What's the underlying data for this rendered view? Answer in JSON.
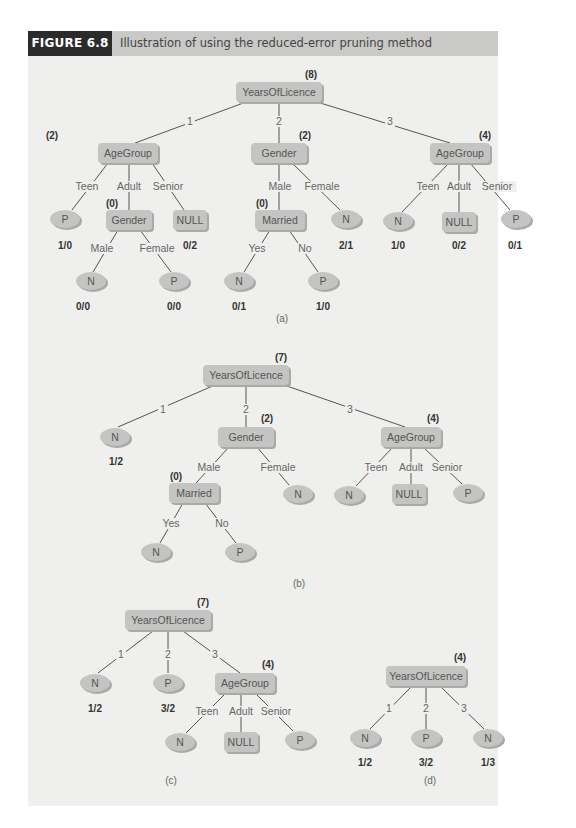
{
  "figure": {
    "label": "FIGURE 6.8",
    "title": "Illustration of using the reduced-error pruning method",
    "colors": {
      "header_dark": "#2b2b2b",
      "header_bar": "#c9c9c7",
      "panel": "#efefed",
      "node": "#c4c4c2"
    }
  },
  "trees": [
    {
      "caption": "(a)",
      "caption_pos": [
        282,
        322
      ],
      "nodes": [
        {
          "id": "a_root",
          "shape": "rect",
          "label": "YearsOfLicence",
          "x": 279,
          "y": 92,
          "w": 86,
          "h": 20,
          "count": "(8)",
          "count_pos": [
            311,
            74
          ]
        },
        {
          "id": "a_age1",
          "shape": "rect",
          "label": "AgeGroup",
          "x": 128,
          "y": 153,
          "w": 60,
          "h": 20,
          "count": "(2)",
          "count_pos": [
            52,
            135
          ]
        },
        {
          "id": "a_gen",
          "shape": "rect",
          "label": "Gender",
          "x": 279,
          "y": 153,
          "w": 56,
          "h": 20,
          "count": "(2)",
          "count_pos": [
            305,
            135
          ]
        },
        {
          "id": "a_age3",
          "shape": "rect",
          "label": "AgeGroup",
          "x": 460,
          "y": 153,
          "w": 60,
          "h": 20,
          "count": "(4)",
          "count_pos": [
            485,
            135
          ]
        },
        {
          "id": "a_p1",
          "shape": "ellipse",
          "label": "P",
          "x": 65,
          "y": 219,
          "w": 30,
          "h": 18,
          "count": "1/0",
          "count_pos": [
            65,
            245
          ]
        },
        {
          "id": "a_gen2",
          "shape": "rect",
          "label": "Gender",
          "x": 129,
          "y": 220,
          "w": 46,
          "h": 20,
          "count": "(0)",
          "count_pos": [
            112,
            203
          ]
        },
        {
          "id": "a_null1",
          "shape": "rect",
          "label": "NULL",
          "x": 190,
          "y": 220,
          "w": 34,
          "h": 20,
          "count": "0/2",
          "count_pos": [
            190,
            245
          ]
        },
        {
          "id": "a_n_m",
          "shape": "ellipse",
          "label": "N",
          "x": 91,
          "y": 281,
          "w": 30,
          "h": 18,
          "count": "0/0",
          "count_pos": [
            83,
            306
          ]
        },
        {
          "id": "a_p_f",
          "shape": "ellipse",
          "label": "P",
          "x": 174,
          "y": 281,
          "w": 30,
          "h": 18,
          "count": "0/0",
          "count_pos": [
            174,
            306
          ]
        },
        {
          "id": "a_mar",
          "shape": "rect",
          "label": "Married",
          "x": 280,
          "y": 220,
          "w": 50,
          "h": 20,
          "count": "(0)",
          "count_pos": [
            262,
            203
          ]
        },
        {
          "id": "a_n_fem",
          "shape": "ellipse",
          "label": "N",
          "x": 346,
          "y": 219,
          "w": 30,
          "h": 18,
          "count": "2/1",
          "count_pos": [
            346,
            245
          ]
        },
        {
          "id": "a_n_yes",
          "shape": "ellipse",
          "label": "N",
          "x": 239,
          "y": 281,
          "w": 30,
          "h": 18,
          "count": "0/1",
          "count_pos": [
            239,
            306
          ]
        },
        {
          "id": "a_p_no",
          "shape": "ellipse",
          "label": "P",
          "x": 323,
          "y": 281,
          "w": 30,
          "h": 18,
          "count": "1/0",
          "count_pos": [
            323,
            306
          ]
        },
        {
          "id": "a_n_teen",
          "shape": "ellipse",
          "label": "N",
          "x": 398,
          "y": 221,
          "w": 30,
          "h": 18,
          "count": "1/0",
          "count_pos": [
            398,
            245
          ]
        },
        {
          "id": "a_null3",
          "shape": "rect",
          "label": "NULL",
          "x": 459,
          "y": 222,
          "w": 34,
          "h": 20,
          "count": "0/2",
          "count_pos": [
            459,
            245
          ]
        },
        {
          "id": "a_p_sen",
          "shape": "ellipse",
          "label": "P",
          "x": 516,
          "y": 219,
          "w": 30,
          "h": 18,
          "count": "0/1",
          "count_pos": [
            515,
            245
          ]
        }
      ],
      "edges": [
        {
          "from": "a_root",
          "to": "a_age1",
          "label": "1",
          "label_pos": [
            190,
            124
          ],
          "x1": 246,
          "y1": 102,
          "x2": 135,
          "y2": 143
        },
        {
          "from": "a_root",
          "to": "a_gen",
          "label": "2",
          "label_pos": [
            279,
            124
          ],
          "x1": 279,
          "y1": 102,
          "x2": 279,
          "y2": 143
        },
        {
          "from": "a_root",
          "to": "a_age3",
          "label": "3",
          "label_pos": [
            390,
            124
          ],
          "x1": 317,
          "y1": 102,
          "x2": 450,
          "y2": 143
        },
        {
          "from": "a_age1",
          "to": "a_p1",
          "label": "Teen",
          "label_pos": [
            87,
            189
          ],
          "x1": 108,
          "y1": 163,
          "x2": 72,
          "y2": 210
        },
        {
          "from": "a_age1",
          "to": "a_gen2",
          "label": "Adult",
          "label_pos": [
            129,
            189
          ],
          "x1": 129,
          "y1": 163,
          "x2": 129,
          "y2": 210
        },
        {
          "from": "a_age1",
          "to": "a_null1",
          "label": "Senior",
          "label_pos": [
            168,
            189
          ],
          "x1": 152,
          "y1": 163,
          "x2": 184,
          "y2": 210
        },
        {
          "from": "a_gen2",
          "to": "a_n_m",
          "label": "Male",
          "label_pos": [
            102,
            251
          ],
          "x1": 118,
          "y1": 230,
          "x2": 93,
          "y2": 272
        },
        {
          "from": "a_gen2",
          "to": "a_p_f",
          "label": "Female",
          "label_pos": [
            157,
            251
          ],
          "x1": 140,
          "y1": 230,
          "x2": 171,
          "y2": 272
        },
        {
          "from": "a_gen",
          "to": "a_mar",
          "label": "Male",
          "label_pos": [
            280,
            189
          ],
          "x1": 279,
          "y1": 163,
          "x2": 279,
          "y2": 210
        },
        {
          "from": "a_gen",
          "to": "a_n_fem",
          "label": "Female",
          "label_pos": [
            322,
            189
          ],
          "x1": 292,
          "y1": 163,
          "x2": 340,
          "y2": 210
        },
        {
          "from": "a_mar",
          "to": "a_n_yes",
          "label": "Yes",
          "label_pos": [
            257,
            251
          ],
          "x1": 270,
          "y1": 230,
          "x2": 244,
          "y2": 272
        },
        {
          "from": "a_mar",
          "to": "a_p_no",
          "label": "No",
          "label_pos": [
            305,
            251
          ],
          "x1": 289,
          "y1": 230,
          "x2": 318,
          "y2": 272
        },
        {
          "from": "a_age3",
          "to": "a_n_teen",
          "label": "Teen",
          "label_pos": [
            428,
            189
          ],
          "x1": 449,
          "y1": 163,
          "x2": 402,
          "y2": 212
        },
        {
          "from": "a_age3",
          "to": "a_null3",
          "label": "Adult",
          "label_pos": [
            459,
            189
          ],
          "x1": 459,
          "y1": 163,
          "x2": 459,
          "y2": 212
        },
        {
          "from": "a_age3",
          "to": "a_p_sen",
          "label": "Senior",
          "label_pos": [
            497,
            189
          ],
          "x1": 470,
          "y1": 163,
          "x2": 510,
          "y2": 210
        }
      ]
    },
    {
      "caption": "(b)",
      "caption_pos": [
        299,
        587
      ],
      "nodes": [
        {
          "id": "b_root",
          "shape": "rect",
          "label": "YearsOfLicence",
          "x": 246,
          "y": 375,
          "w": 86,
          "h": 20,
          "count": "(7)",
          "count_pos": [
            281,
            357
          ]
        },
        {
          "id": "b_n1",
          "shape": "ellipse",
          "label": "N",
          "x": 115,
          "y": 437,
          "w": 30,
          "h": 18,
          "count": "1/2",
          "count_pos": [
            116,
            461
          ]
        },
        {
          "id": "b_gen",
          "shape": "rect",
          "label": "Gender",
          "x": 246,
          "y": 437,
          "w": 56,
          "h": 20,
          "count": "(2)",
          "count_pos": [
            267,
            418
          ]
        },
        {
          "id": "b_age",
          "shape": "rect",
          "label": "AgeGroup",
          "x": 411,
          "y": 437,
          "w": 60,
          "h": 20,
          "count": "(4)",
          "count_pos": [
            433,
            418
          ]
        },
        {
          "id": "b_mar",
          "shape": "rect",
          "label": "Married",
          "x": 194,
          "y": 493,
          "w": 50,
          "h": 20,
          "count": "(0)",
          "count_pos": [
            176,
            476
          ]
        },
        {
          "id": "b_n_fem",
          "shape": "ellipse",
          "label": "N",
          "x": 298,
          "y": 494,
          "w": 30,
          "h": 18
        },
        {
          "id": "b_n_teen",
          "shape": "ellipse",
          "label": "N",
          "x": 349,
          "y": 495,
          "w": 30,
          "h": 18
        },
        {
          "id": "b_null",
          "shape": "rect",
          "label": "NULL",
          "x": 409,
          "y": 494,
          "w": 34,
          "h": 20
        },
        {
          "id": "b_p_sen",
          "shape": "ellipse",
          "label": "P",
          "x": 468,
          "y": 493,
          "w": 30,
          "h": 18
        },
        {
          "id": "b_n_yes",
          "shape": "ellipse",
          "label": "N",
          "x": 156,
          "y": 552,
          "w": 30,
          "h": 18
        },
        {
          "id": "b_p_no",
          "shape": "ellipse",
          "label": "P",
          "x": 240,
          "y": 552,
          "w": 30,
          "h": 18
        }
      ],
      "edges": [
        {
          "from": "b_root",
          "to": "b_n1",
          "label": "1",
          "label_pos": [
            163,
            412
          ],
          "x1": 215,
          "y1": 385,
          "x2": 118,
          "y2": 427
        },
        {
          "from": "b_root",
          "to": "b_gen",
          "label": "2",
          "label_pos": [
            246,
            412
          ],
          "x1": 246,
          "y1": 385,
          "x2": 246,
          "y2": 427
        },
        {
          "from": "b_root",
          "to": "b_age",
          "label": "3",
          "label_pos": [
            350,
            412
          ],
          "x1": 284,
          "y1": 385,
          "x2": 405,
          "y2": 427
        },
        {
          "from": "b_gen",
          "to": "b_mar",
          "label": "Male",
          "label_pos": [
            209,
            470
          ],
          "x1": 229,
          "y1": 447,
          "x2": 196,
          "y2": 483
        },
        {
          "from": "b_gen",
          "to": "b_n_fem",
          "label": "Female",
          "label_pos": [
            278,
            470
          ],
          "x1": 257,
          "y1": 447,
          "x2": 289,
          "y2": 485
        },
        {
          "from": "b_age",
          "to": "b_n_teen",
          "label": "Teen",
          "label_pos": [
            376,
            470
          ],
          "x1": 393,
          "y1": 447,
          "x2": 356,
          "y2": 486
        },
        {
          "from": "b_age",
          "to": "b_null",
          "label": "Adult",
          "label_pos": [
            411,
            470
          ],
          "x1": 411,
          "y1": 447,
          "x2": 411,
          "y2": 484
        },
        {
          "from": "b_age",
          "to": "b_p_sen",
          "label": "Senior",
          "label_pos": [
            447,
            470
          ],
          "x1": 423,
          "y1": 447,
          "x2": 462,
          "y2": 484
        },
        {
          "from": "b_mar",
          "to": "b_n_yes",
          "label": "Yes",
          "label_pos": [
            171,
            526
          ],
          "x1": 183,
          "y1": 503,
          "x2": 160,
          "y2": 543
        },
        {
          "from": "b_mar",
          "to": "b_p_no",
          "label": "No",
          "label_pos": [
            222,
            526
          ],
          "x1": 205,
          "y1": 503,
          "x2": 236,
          "y2": 543
        }
      ]
    },
    {
      "caption": "(c)",
      "caption_pos": [
        171,
        784
      ],
      "nodes": [
        {
          "id": "c_root",
          "shape": "rect",
          "label": "YearsOfLicence",
          "x": 168,
          "y": 620,
          "w": 86,
          "h": 20,
          "count": "(7)",
          "count_pos": [
            203,
            602
          ]
        },
        {
          "id": "c_n1",
          "shape": "ellipse",
          "label": "N",
          "x": 95,
          "y": 683,
          "w": 30,
          "h": 18,
          "count": "1/2",
          "count_pos": [
            95,
            708
          ]
        },
        {
          "id": "c_p2",
          "shape": "ellipse",
          "label": "P",
          "x": 168,
          "y": 683,
          "w": 30,
          "h": 18,
          "count": "3/2",
          "count_pos": [
            168,
            708
          ]
        },
        {
          "id": "c_age",
          "shape": "rect",
          "label": "AgeGroup",
          "x": 245,
          "y": 683,
          "w": 60,
          "h": 20,
          "count": "(4)",
          "count_pos": [
            268,
            664
          ]
        },
        {
          "id": "c_n_teen",
          "shape": "ellipse",
          "label": "N",
          "x": 180,
          "y": 742,
          "w": 30,
          "h": 18
        },
        {
          "id": "c_null",
          "shape": "rect",
          "label": "NULL",
          "x": 241,
          "y": 742,
          "w": 34,
          "h": 20
        },
        {
          "id": "c_p_sen",
          "shape": "ellipse",
          "label": "P",
          "x": 300,
          "y": 740,
          "w": 30,
          "h": 18
        }
      ],
      "edges": [
        {
          "from": "c_root",
          "to": "c_n1",
          "label": "1",
          "label_pos": [
            121,
            657
          ],
          "x1": 153,
          "y1": 631,
          "x2": 98,
          "y2": 673
        },
        {
          "from": "c_root",
          "to": "c_p2",
          "label": "2",
          "label_pos": [
            168,
            657
          ],
          "x1": 168,
          "y1": 631,
          "x2": 168,
          "y2": 673
        },
        {
          "from": "c_root",
          "to": "c_age",
          "label": "3",
          "label_pos": [
            215,
            657
          ],
          "x1": 183,
          "y1": 631,
          "x2": 240,
          "y2": 673
        },
        {
          "from": "c_age",
          "to": "c_n_teen",
          "label": "Teen",
          "label_pos": [
            207,
            714
          ],
          "x1": 226,
          "y1": 693,
          "x2": 186,
          "y2": 733
        },
        {
          "from": "c_age",
          "to": "c_null",
          "label": "Adult",
          "label_pos": [
            241,
            714
          ],
          "x1": 241,
          "y1": 693,
          "x2": 241,
          "y2": 732
        },
        {
          "from": "c_age",
          "to": "c_p_sen",
          "label": "Senior",
          "label_pos": [
            276,
            714
          ],
          "x1": 255,
          "y1": 693,
          "x2": 293,
          "y2": 731
        }
      ]
    },
    {
      "caption": "(d)",
      "caption_pos": [
        430,
        784
      ],
      "nodes": [
        {
          "id": "d_root",
          "shape": "rect",
          "label": "YearsOfLicence",
          "x": 426,
          "y": 676,
          "w": 80,
          "h": 20,
          "count": "(4)",
          "count_pos": [
            460,
            657
          ]
        },
        {
          "id": "d_n1",
          "shape": "ellipse",
          "label": "N",
          "x": 365,
          "y": 738,
          "w": 30,
          "h": 18,
          "count": "1/2",
          "count_pos": [
            365,
            762
          ]
        },
        {
          "id": "d_p2",
          "shape": "ellipse",
          "label": "P",
          "x": 426,
          "y": 738,
          "w": 30,
          "h": 18,
          "count": "3/2",
          "count_pos": [
            426,
            762
          ]
        },
        {
          "id": "d_n3",
          "shape": "ellipse",
          "label": "N",
          "x": 488,
          "y": 738,
          "w": 30,
          "h": 18,
          "count": "1/3",
          "count_pos": [
            488,
            762
          ]
        }
      ],
      "edges": [
        {
          "from": "d_root",
          "to": "d_n1",
          "label": "1",
          "label_pos": [
            389,
            711
          ],
          "x1": 410,
          "y1": 688,
          "x2": 370,
          "y2": 729
        },
        {
          "from": "d_root",
          "to": "d_p2",
          "label": "2",
          "label_pos": [
            426,
            711
          ],
          "x1": 426,
          "y1": 688,
          "x2": 426,
          "y2": 729
        },
        {
          "from": "d_root",
          "to": "d_n3",
          "label": "3",
          "label_pos": [
            464,
            711
          ],
          "x1": 442,
          "y1": 688,
          "x2": 484,
          "y2": 729
        }
      ]
    }
  ]
}
